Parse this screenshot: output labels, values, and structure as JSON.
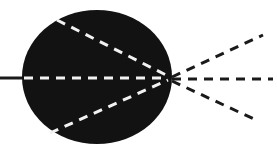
{
  "diagram": {
    "type": "ray-diagram",
    "colors": {
      "background": "#ffffff",
      "body": "#121212",
      "inner_rays": "#f2f2f2",
      "outer_rays": "#1a1a1a",
      "incoming_line": "#1a1a1a"
    },
    "body": {
      "cx": 97,
      "cy": 77,
      "rx": 75,
      "ry": 67
    },
    "focal_point": {
      "x": 170,
      "y": 78
    },
    "incoming_line": {
      "x1": 0,
      "y1": 78,
      "x2": 24,
      "y2": 78
    },
    "inner_rays": [
      {
        "x1": 57,
        "y1": 20,
        "x2": 168,
        "y2": 76
      },
      {
        "x1": 24,
        "y1": 78,
        "x2": 168,
        "y2": 78
      },
      {
        "x1": 50,
        "y1": 133,
        "x2": 168,
        "y2": 80
      }
    ],
    "outer_rays": [
      {
        "x1": 172,
        "y1": 77,
        "x2": 263,
        "y2": 35
      },
      {
        "x1": 172,
        "y1": 79,
        "x2": 273,
        "y2": 79
      },
      {
        "x1": 172,
        "y1": 81,
        "x2": 256,
        "y2": 120
      }
    ]
  }
}
